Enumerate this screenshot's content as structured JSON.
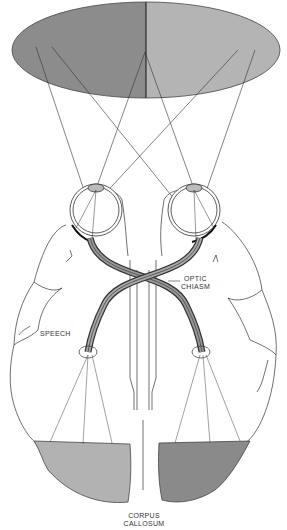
{
  "diagram": {
    "type": "visual-pathway-brain-diagram",
    "visual_field": {
      "left_half_color": "#8c8c8c",
      "right_half_color": "#b4b4b4"
    },
    "occipital_lobes": {
      "left_color": "#b2b2b2",
      "right_color": "#8a8a8a"
    },
    "labels": {
      "optic_chiasm_line1": "OPTIC",
      "optic_chiasm_line2": "CHIASM",
      "speech": "SPEECH",
      "corpus_callosum_line1": "CORPUS",
      "corpus_callosum_line2": "CALLOSUM"
    },
    "line_color": "#333333"
  }
}
